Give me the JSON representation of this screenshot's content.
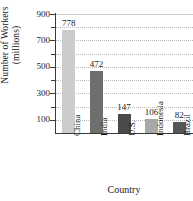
{
  "chart_data": {
    "type": "bar",
    "title": "",
    "xlabel": "Country",
    "ylabel_lines": [
      "Number of Workers",
      "(millions)"
    ],
    "ylabel": "Number of Workers (millions)",
    "categories": [
      "China",
      "India",
      "U.S.",
      "Indonesia",
      "Brazil"
    ],
    "values": [
      778,
      472,
      147,
      106,
      82
    ],
    "value_labels": [
      "778",
      "472",
      "147",
      "106",
      "82"
    ],
    "ylim": [
      0,
      900
    ],
    "y_tick_labels": [
      "900",
      "700",
      "500",
      "300",
      "100"
    ],
    "y_tick_values": [
      900,
      700,
      500,
      300,
      100
    ],
    "y_minor_tick_values": [
      800,
      600,
      400,
      200
    ],
    "grid": true,
    "grid_style": "dotted-horizontal",
    "legend": "none",
    "bar_colors": [
      "#cccccc",
      "#6e6e6e",
      "#4a4a4a",
      "#a8a8a8",
      "#555555"
    ],
    "axis_color": "#3a3a3a",
    "grid_color": "#b9b9b9"
  }
}
